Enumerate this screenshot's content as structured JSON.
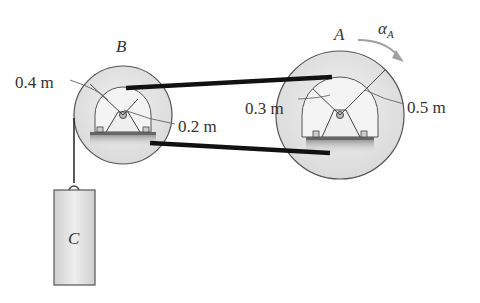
{
  "diagram": {
    "pulley_b": {
      "label": "B",
      "outer_radius": "0.4 m",
      "inner_radius": "0.2 m"
    },
    "pulley_a": {
      "label": "A",
      "outer_radius": "0.5 m",
      "inner_radius": "0.3 m",
      "angular_accel": "α",
      "angular_accel_sub": "A"
    },
    "block": {
      "label": "C"
    }
  },
  "colors": {
    "disk_fill": "#e4e4e4",
    "belt": "#111111",
    "stroke": "#555555",
    "arrow_gray": "#a0a0a0"
  }
}
